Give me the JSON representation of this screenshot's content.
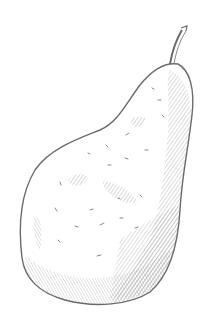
{
  "image": {
    "subject": "pear",
    "style": "pencil sketch",
    "colors": {
      "background": "#ffffff",
      "outline": "#6b6b6b",
      "hatch": "#9a9a9a",
      "shade": "#b5b5b5"
    }
  }
}
